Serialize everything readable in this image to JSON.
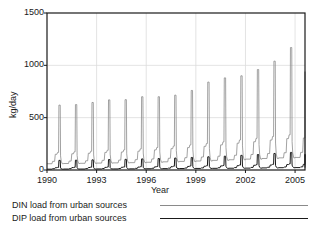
{
  "chart_data": {
    "type": "line",
    "title": "",
    "xlabel": "Year",
    "ylabel": "kg/day",
    "xlim": [
      1990,
      2005.6
    ],
    "ylim": [
      0,
      1500
    ],
    "xticks": [
      1990,
      1993,
      1996,
      1999,
      2002,
      2005
    ],
    "xticklabels": [
      "1990",
      "1993",
      "1996",
      "1999",
      "2002",
      "2005"
    ],
    "yticks": [
      0,
      500,
      1000,
      1500
    ],
    "yticklabels": [
      "0",
      "500",
      "1000",
      "1500"
    ],
    "grid": true,
    "legend_position": "below-axes",
    "series": [
      {
        "name": "DIN load from urban sources",
        "color": "#8a8a8a",
        "annual_baseline": [
          60,
          62,
          64,
          66,
          68,
          70,
          74,
          78,
          82,
          86,
          92,
          98,
          104,
          110,
          116,
          120
        ],
        "annual_shoulder": [
          150,
          155,
          160,
          168,
          172,
          180,
          192,
          204,
          214,
          226,
          240,
          256,
          270,
          286,
          300,
          306
        ],
        "annual_peak": [
          620,
          625,
          645,
          670,
          672,
          700,
          700,
          715,
          760,
          840,
          880,
          900,
          960,
          1040,
          1170,
          940
        ],
        "years": [
          1990,
          1991,
          1992,
          1993,
          1994,
          1995,
          1996,
          1997,
          1998,
          1999,
          2000,
          2001,
          2002,
          2003,
          2004,
          2005
        ]
      },
      {
        "name": "DIP load from urban sources",
        "color": "#1a1a1a",
        "annual_baseline": [
          8,
          9,
          9,
          10,
          10,
          11,
          12,
          13,
          14,
          15,
          16,
          17,
          18,
          20,
          22,
          23
        ],
        "annual_shoulder": [
          22,
          23,
          24,
          25,
          26,
          28,
          30,
          32,
          34,
          36,
          39,
          42,
          45,
          48,
          52,
          54
        ],
        "annual_peak": [
          92,
          94,
          97,
          100,
          102,
          106,
          110,
          114,
          120,
          126,
          132,
          140,
          148,
          158,
          168,
          150
        ],
        "years": [
          1990,
          1991,
          1992,
          1993,
          1994,
          1995,
          1996,
          1997,
          1998,
          1999,
          2000,
          2001,
          2002,
          2003,
          2004,
          2005
        ]
      }
    ]
  },
  "legend": {
    "din_label": "DIN load from urban sources",
    "dip_label": "DIP load from urban sources"
  }
}
